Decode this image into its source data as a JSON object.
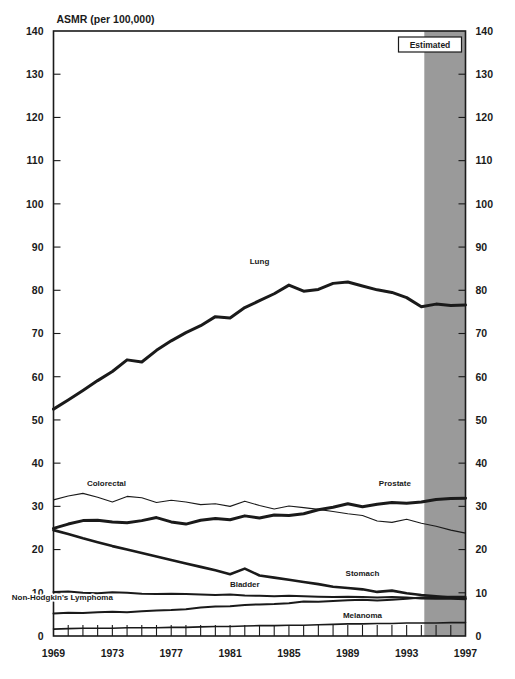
{
  "chart_data": {
    "type": "line",
    "title": "ASMR (per 100,000)",
    "xlabel": "",
    "ylabel": "ASMR (per 100,000)",
    "ylim": [
      0,
      140
    ],
    "ytick_step": 10,
    "yticks": [
      0,
      10,
      20,
      30,
      40,
      50,
      60,
      70,
      80,
      90,
      100,
      110,
      120,
      130,
      140
    ],
    "ytick_labels": [
      "0",
      "10",
      "20",
      "30",
      "40",
      "50",
      "60",
      "70",
      "80",
      "90",
      "100",
      "110",
      "120",
      "130",
      "140"
    ],
    "xlim": [
      1969,
      1997
    ],
    "x": [
      1969,
      1970,
      1971,
      1972,
      1973,
      1974,
      1975,
      1976,
      1977,
      1978,
      1979,
      1980,
      1981,
      1982,
      1983,
      1984,
      1985,
      1986,
      1987,
      1988,
      1989,
      1990,
      1991,
      1992,
      1993,
      1994,
      1995,
      1996,
      1997
    ],
    "xticks": [
      1969,
      1973,
      1977,
      1981,
      1985,
      1989,
      1993,
      1997
    ],
    "xtick_labels": [
      "1969",
      "1973",
      "1977",
      "1981",
      "1985",
      "1989",
      "1993",
      "1997"
    ],
    "grid": false,
    "legend_position": "inline-annotations",
    "estimated_region": {
      "label": "Estimated",
      "from_x": 1994.2,
      "to_x": 1997,
      "fill": "#9a9a9a"
    },
    "series": [
      {
        "name": "Lung",
        "label": "Lung",
        "stroke": "#1a1a1a",
        "width": 3.0,
        "label_x": 1983.0,
        "label_y": 86.0,
        "values": [
          52.5,
          54.6,
          56.8,
          59.1,
          61.2,
          63.9,
          63.4,
          66.1,
          68.3,
          70.2,
          71.8,
          73.9,
          73.6,
          76.0,
          77.6,
          79.2,
          81.2,
          79.8,
          80.2,
          81.6,
          81.9,
          81.0,
          80.1,
          79.5,
          78.3,
          76.2,
          76.8,
          76.5,
          76.6
        ]
      },
      {
        "name": "Colorectal",
        "label": "Colorectal",
        "stroke": "#1a1a1a",
        "width": 1.1,
        "label_x": 1972.6,
        "label_y": 34.6,
        "values": [
          31.5,
          32.4,
          33.0,
          32.1,
          31.0,
          32.3,
          32.0,
          30.9,
          31.4,
          31.0,
          30.4,
          30.6,
          30.0,
          31.2,
          30.2,
          29.4,
          30.1,
          29.7,
          29.3,
          28.8,
          28.3,
          27.9,
          26.6,
          26.3,
          27.0,
          26.1,
          25.4,
          24.5,
          23.8
        ]
      },
      {
        "name": "Prostate",
        "label": "Prostate",
        "stroke": "#1a1a1a",
        "width": 3.0,
        "label_x": 1992.2,
        "label_y": 34.8,
        "values": [
          24.9,
          25.9,
          26.7,
          26.8,
          26.4,
          26.2,
          26.7,
          27.4,
          26.4,
          25.9,
          26.8,
          27.2,
          26.9,
          27.8,
          27.3,
          28.0,
          27.9,
          28.3,
          29.2,
          29.8,
          30.6,
          29.9,
          30.5,
          30.9,
          30.7,
          31.0,
          31.6,
          31.8,
          31.9
        ]
      },
      {
        "name": "Stomach",
        "label": "Stomach",
        "stroke": "#1a1a1a",
        "width": 2.6,
        "label_x": 1990.0,
        "label_y": 14.0,
        "values": [
          24.5,
          23.6,
          22.6,
          21.7,
          20.8,
          20.0,
          19.2,
          18.4,
          17.6,
          16.8,
          16.0,
          15.2,
          14.3,
          15.6,
          14.0,
          13.5,
          13.0,
          12.5,
          12.0,
          11.4,
          11.1,
          10.8,
          10.2,
          10.5,
          9.9,
          9.5,
          9.2,
          8.9,
          8.7
        ]
      },
      {
        "name": "Bladder",
        "label": "Bladder",
        "stroke": "#1a1a1a",
        "width": 2.0,
        "label_x": 1982.0,
        "label_y": 11.4,
        "values": [
          10.2,
          10.3,
          10.0,
          9.9,
          10.1,
          10.0,
          9.8,
          9.7,
          9.8,
          9.7,
          9.6,
          9.5,
          9.6,
          9.4,
          9.3,
          9.2,
          9.3,
          9.2,
          9.1,
          9.0,
          9.1,
          9.0,
          8.9,
          9.0,
          8.9,
          8.7,
          8.6,
          8.6,
          8.5
        ]
      },
      {
        "name": "Non-Hodgkin's Lymphoma",
        "label": "Non-Hodgkin's Lymphoma",
        "stroke": "#1a1a1a",
        "width": 2.0,
        "label_x": 1969.6,
        "label_y": 8.3,
        "values": [
          5.2,
          5.4,
          5.3,
          5.5,
          5.6,
          5.5,
          5.7,
          5.9,
          6.0,
          6.2,
          6.6,
          6.8,
          6.9,
          7.2,
          7.3,
          7.4,
          7.6,
          8.0,
          7.9,
          8.1,
          8.3,
          8.4,
          8.2,
          8.4,
          8.6,
          8.9,
          9.0,
          9.1,
          9.1
        ]
      },
      {
        "name": "Melanoma",
        "label": "Melanoma",
        "stroke": "#1a1a1a",
        "width": 1.6,
        "label_x": 1990.0,
        "label_y": 4.1,
        "values": [
          1.6,
          1.7,
          1.8,
          1.8,
          1.8,
          1.9,
          1.9,
          1.9,
          2.0,
          2.0,
          2.1,
          2.2,
          2.2,
          2.3,
          2.4,
          2.4,
          2.5,
          2.5,
          2.6,
          2.7,
          2.8,
          2.8,
          2.9,
          2.9,
          3.0,
          3.0,
          3.0,
          3.1,
          3.1
        ]
      }
    ]
  },
  "axis": {
    "title": "ASMR (per 100,000)"
  }
}
